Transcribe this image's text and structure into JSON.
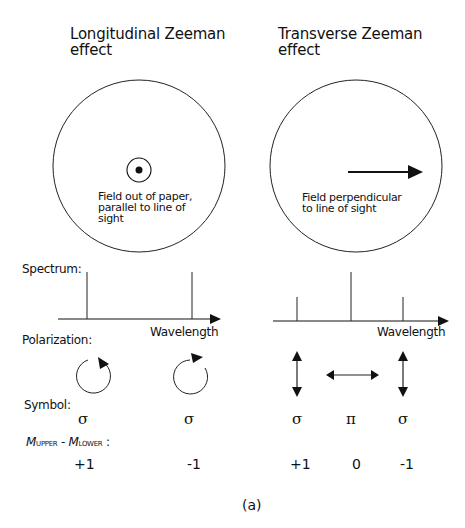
{
  "left_panel": {
    "title_line1": "Longitudinal Zeeman",
    "title_line2": "effect",
    "field_icon": "field-out-of-paper-dot-icon",
    "field_caption": [
      "Field out of paper,",
      "parallel to line of",
      "sight"
    ],
    "spectrum_lines": [
      {
        "position": "lower-wavelength",
        "relative_height": 1.0
      },
      {
        "position": "higher-wavelength",
        "relative_height": 1.0
      }
    ],
    "polarization": [
      "circular-clockwise-icon",
      "circular-clockwise-icon"
    ],
    "symbols": [
      "σ",
      "σ"
    ],
    "delta_m": [
      "+1",
      "-1"
    ]
  },
  "right_panel": {
    "title_line1": "Transverse Zeeman",
    "title_line2": "effect",
    "field_icon": "field-arrow-right-icon",
    "field_caption": [
      "Field perpendicular",
      "to line of sight"
    ],
    "spectrum_lines": [
      {
        "position": "lower-wavelength",
        "relative_height": 0.5
      },
      {
        "position": "center",
        "relative_height": 1.0
      },
      {
        "position": "higher-wavelength",
        "relative_height": 0.5
      }
    ],
    "polarization": [
      "vertical-double-arrow-icon",
      "horizontal-double-arrow-icon",
      "vertical-double-arrow-icon"
    ],
    "symbols": [
      "σ",
      "π",
      "σ"
    ],
    "delta_m": [
      "+1",
      "0",
      "-1"
    ]
  },
  "row_labels": {
    "spectrum": "Spectrum:",
    "polarization": "Polarization:",
    "symbol": "Symbol:",
    "delta_m_M1": "M",
    "delta_m_sub1": "UPPER",
    "delta_m_sep": " - ",
    "delta_m_M2": "M",
    "delta_m_sub2": "LOWER",
    "delta_m_colon": " :"
  },
  "axis_label": "Wavelength",
  "panel_label": "(a)"
}
